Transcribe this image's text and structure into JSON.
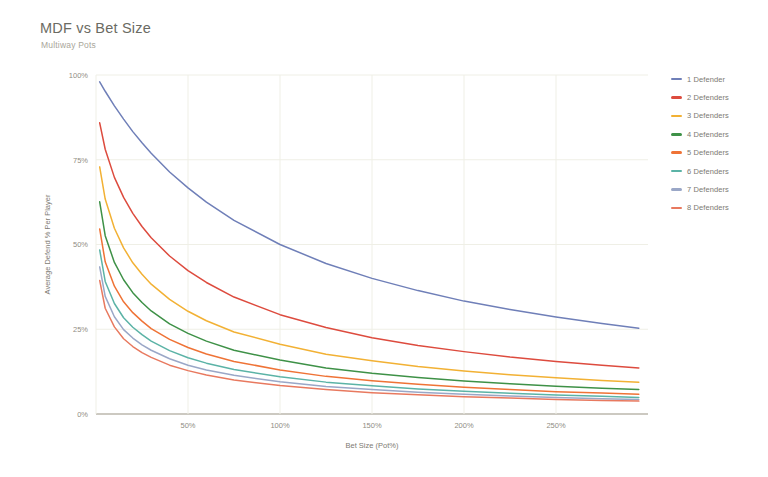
{
  "chart_data": {
    "type": "line",
    "title": "MDF vs Bet Size",
    "subtitle": "Multiway Pots",
    "xlabel": "Bet Size (Pot%)",
    "ylabel": "Average Defend % Per Player",
    "xlim": [
      0,
      300
    ],
    "ylim": [
      0,
      100
    ],
    "grid": true,
    "legend_position": "right",
    "x_ticks": [
      "50%",
      "100%",
      "150%",
      "200%",
      "250%"
    ],
    "x_tick_values": [
      50,
      100,
      150,
      200,
      250
    ],
    "y_ticks": [
      "0%",
      "25%",
      "50%",
      "75%",
      "100%"
    ],
    "y_tick_values": [
      0,
      25,
      50,
      75,
      100
    ],
    "x": [
      2,
      5,
      10,
      15,
      20,
      25,
      30,
      40,
      50,
      60,
      75,
      100,
      125,
      150,
      175,
      200,
      225,
      250,
      275,
      295
    ],
    "series": [
      {
        "name": "1 Defender",
        "color": "#6f7fb8",
        "values": [
          98.0,
          95.2,
          90.9,
          87.0,
          83.3,
          80.0,
          76.9,
          71.4,
          66.7,
          62.5,
          57.1,
          50.0,
          44.4,
          40.0,
          36.4,
          33.3,
          30.8,
          28.6,
          26.7,
          25.3
        ]
      },
      {
        "name": "2 Defenders",
        "color": "#dd4b3e",
        "values": [
          85.9,
          78.1,
          69.8,
          63.9,
          59.2,
          55.3,
          52.0,
          46.6,
          42.3,
          38.8,
          34.5,
          29.3,
          25.5,
          22.5,
          20.2,
          18.4,
          16.8,
          15.5,
          14.4,
          13.6
        ]
      },
      {
        "name": "3 Defenders",
        "color": "#f2b134",
        "values": [
          72.9,
          63.4,
          54.8,
          49.0,
          44.6,
          41.2,
          38.3,
          33.8,
          30.3,
          27.5,
          24.2,
          20.6,
          17.6,
          15.7,
          14.0,
          12.7,
          11.6,
          10.7,
          9.9,
          9.4
        ]
      },
      {
        "name": "4 Defenders",
        "color": "#3e9147",
        "values": [
          62.6,
          52.6,
          44.7,
          39.6,
          35.8,
          32.9,
          30.4,
          26.6,
          23.8,
          21.5,
          18.8,
          15.9,
          13.6,
          12.0,
          10.8,
          9.7,
          8.9,
          8.2,
          7.6,
          7.2
        ]
      },
      {
        "name": "5 Defenders",
        "color": "#ef7336",
        "values": [
          54.6,
          44.9,
          37.7,
          33.1,
          29.9,
          27.4,
          25.2,
          22.0,
          19.6,
          17.7,
          15.5,
          13.0,
          11.1,
          9.8,
          8.8,
          7.9,
          7.2,
          6.6,
          6.2,
          5.8
        ]
      },
      {
        "name": "6 Defenders",
        "color": "#5bb3a6",
        "values": [
          48.4,
          39.1,
          32.6,
          28.4,
          25.6,
          23.4,
          21.5,
          18.7,
          16.6,
          15.0,
          13.1,
          11.0,
          9.4,
          8.3,
          7.4,
          6.7,
          6.1,
          5.6,
          5.2,
          4.9
        ]
      },
      {
        "name": "7 Defenders",
        "color": "#9aa7c7",
        "values": [
          43.4,
          34.7,
          28.7,
          24.9,
          22.4,
          20.4,
          18.8,
          16.3,
          14.4,
          13.0,
          11.4,
          9.5,
          8.1,
          7.2,
          6.4,
          5.8,
          5.3,
          4.9,
          4.5,
          4.3
        ]
      },
      {
        "name": "8 Defenders",
        "color": "#e8795f",
        "values": [
          39.4,
          31.2,
          25.7,
          22.2,
          19.9,
          18.1,
          16.7,
          14.4,
          12.8,
          11.5,
          10.0,
          8.4,
          7.2,
          6.3,
          5.7,
          5.1,
          4.7,
          4.3,
          4.0,
          3.8
        ]
      }
    ]
  },
  "legend": {
    "items": [
      {
        "label": "1 Defender",
        "color": "#6f7fb8"
      },
      {
        "label": "2 Defenders",
        "color": "#dd4b3e"
      },
      {
        "label": "3 Defenders",
        "color": "#f2b134"
      },
      {
        "label": "4 Defenders",
        "color": "#3e9147"
      },
      {
        "label": "5 Defenders",
        "color": "#ef7336"
      },
      {
        "label": "6 Defenders",
        "color": "#5bb3a6"
      },
      {
        "label": "7 Defenders",
        "color": "#9aa7c7"
      },
      {
        "label": "8 Defenders",
        "color": "#e8795f"
      }
    ]
  },
  "theme": {
    "background": "#ffffff",
    "grid_color": "#efefe6",
    "axis_color": "#9a9483",
    "title_color": "#6b6b63",
    "subtitle_color": "#a9a69a",
    "tick_color": "#908d84"
  }
}
